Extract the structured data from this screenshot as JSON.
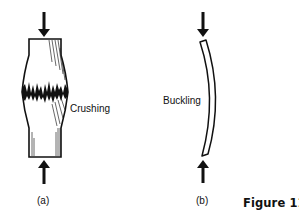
{
  "figure": {
    "title": "Figure 11–2",
    "panels": [
      {
        "id": "a",
        "caption": "(a)",
        "label": "Crushing",
        "description": "short thick column under axial compression, crushed in the middle"
      },
      {
        "id": "b",
        "caption": "(b)",
        "label": "Buckling",
        "description": "slender column under axial compression, bowed sideways"
      }
    ]
  },
  "colors": {
    "ink": "#111111",
    "background": "#ffffff"
  },
  "icons": {
    "load_arrow": "arrow-down / arrow-up (compressive load)"
  }
}
